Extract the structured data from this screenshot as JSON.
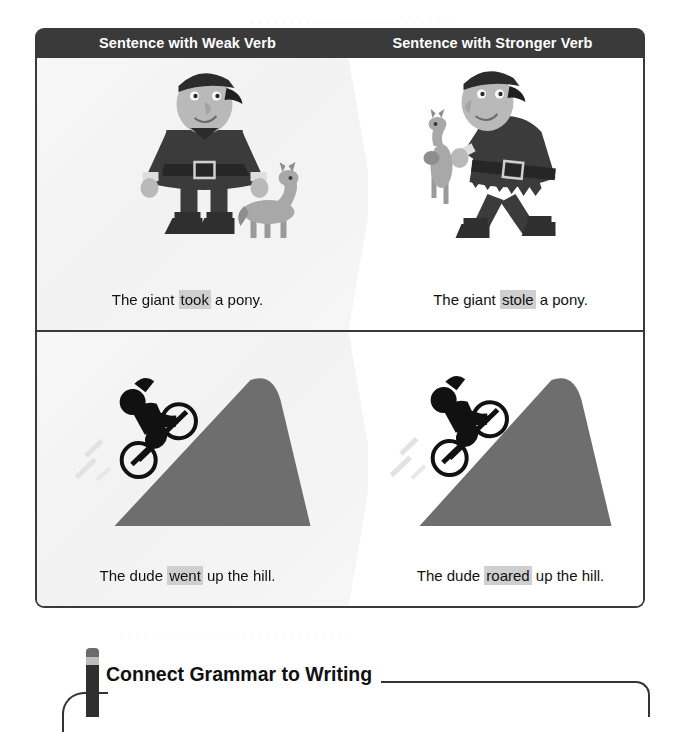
{
  "table": {
    "headers": [
      {
        "label": "Sentence with Weak Verb"
      },
      {
        "label": "Sentence with Stronger Verb"
      }
    ],
    "rows": [
      {
        "left": {
          "art": "giant-standing-with-pony",
          "before": "The giant ",
          "verb": "took",
          "after": " a pony."
        },
        "right": {
          "art": "giant-carrying-pony",
          "before": "The giant ",
          "verb": "stole",
          "after": " a pony."
        }
      },
      {
        "left": {
          "art": "cyclist-riding-up-hill",
          "before": "The dude ",
          "verb": "went",
          "after": " up the hill."
        },
        "right": {
          "art": "cyclist-roaring-up-hill",
          "before": "The dude ",
          "verb": "roared",
          "after": " up the hill."
        }
      }
    ]
  },
  "banner": {
    "title": "Connect Grammar to Writing",
    "icon": "pencil-icon"
  },
  "colors": {
    "header_bar": "#3a3a3a",
    "border": "#3a3a3a",
    "highlight": "#cfcfcf",
    "hill": "#6e6e6e",
    "figure_dark": "#3b3b3b",
    "figure_skin": "#b9b9b9",
    "page_background": "#ffffff"
  }
}
